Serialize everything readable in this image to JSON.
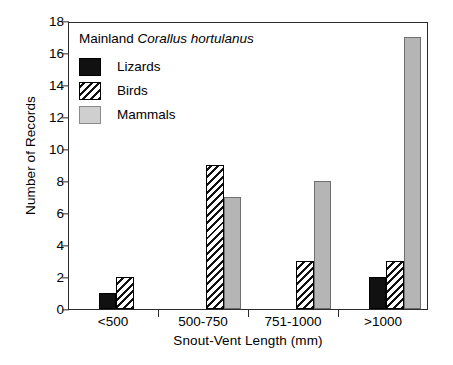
{
  "chart_data": {
    "type": "bar",
    "title": "Mainland Corallus hortulanus",
    "title_prefix": "Mainland",
    "title_species": "Corallus hortulanus",
    "xlabel": "Snout-Vent Length (mm)",
    "ylabel": "Number of Records",
    "categories": [
      "<500",
      "500-750",
      "751-1000",
      ">1000"
    ],
    "series": [
      {
        "name": "Lizards",
        "values": [
          1,
          0,
          0,
          2
        ],
        "color": "#111111",
        "pattern": "solid-black"
      },
      {
        "name": "Birds",
        "values": [
          2,
          9,
          3,
          3
        ],
        "color": "#ffffff",
        "pattern": "diagonal-hatch"
      },
      {
        "name": "Mammals",
        "values": [
          0,
          7,
          8,
          17
        ],
        "color": "#b5b5b5",
        "pattern": "solid-gray"
      }
    ],
    "ylim": [
      0,
      18
    ],
    "yticks": [
      0,
      2,
      4,
      6,
      8,
      10,
      12,
      14,
      16,
      18
    ],
    "ytick_labels": [
      "0",
      "2",
      "4",
      "6",
      "8",
      "10",
      "12",
      "14",
      "16",
      "18"
    ],
    "grid": false,
    "legend_position": "upper-left-inside",
    "legend_entries": [
      "Lizards",
      "Birds",
      "Mammals"
    ],
    "frame": "box",
    "bar_group_order": [
      "Lizards",
      "Birds",
      "Mammals"
    ]
  }
}
